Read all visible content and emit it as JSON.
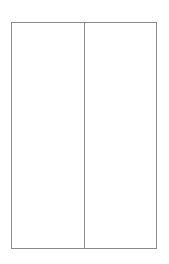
{
  "page": {
    "background_color": "#ffffff",
    "width": 169,
    "height": 264
  },
  "frame": {
    "border_color": "#8a8a8a",
    "border_width": 1,
    "fill_color": "#ffffff",
    "divider_color": "#8a8a8a",
    "divider_width": 1
  },
  "columns": [
    {
      "id": "left",
      "label": "",
      "content": ""
    },
    {
      "id": "right",
      "label": "",
      "content": ""
    }
  ]
}
